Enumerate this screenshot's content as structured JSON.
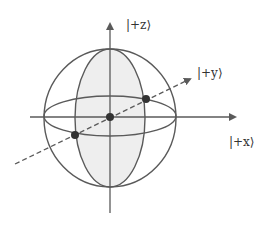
{
  "diagram": {
    "type": "bloch-sphere",
    "labels": {
      "z": "|+z⟩",
      "y": "|+y⟩",
      "x": "|+x⟩"
    },
    "colors": {
      "stroke": "#5a5a5a",
      "shaded_fill": "#eeeeee",
      "dot": "#333333",
      "background": "#ffffff"
    },
    "points": [
      {
        "name": "center",
        "x": 110,
        "y": 117
      },
      {
        "name": "front-left",
        "x": 75,
        "y": 135
      },
      {
        "name": "back-right",
        "x": 146,
        "y": 99
      }
    ]
  }
}
